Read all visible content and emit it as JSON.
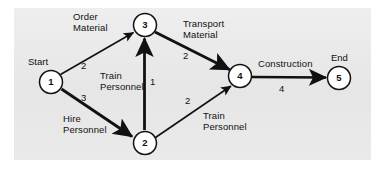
{
  "diagram": {
    "type": "activity-on-arc network",
    "background_color": "#e9e9e9",
    "page_color": "#ffffff",
    "line_color": "#111111",
    "node_fill": "#ffffff",
    "nodes": [
      {
        "id": "1",
        "label": "1",
        "cx": 51,
        "cy": 82,
        "r": 12,
        "terminal_label": "Start"
      },
      {
        "id": "2",
        "label": "2",
        "cx": 145,
        "cy": 143,
        "r": 12,
        "terminal_label": ""
      },
      {
        "id": "3",
        "label": "3",
        "cx": 145,
        "cy": 25,
        "r": 12,
        "terminal_label": ""
      },
      {
        "id": "4",
        "label": "4",
        "cx": 240,
        "cy": 76,
        "r": 12,
        "terminal_label": ""
      },
      {
        "id": "5",
        "label": "5",
        "cx": 339,
        "cy": 78,
        "r": 12,
        "terminal_label": "End"
      }
    ],
    "edges": [
      {
        "from": "1",
        "to": "3",
        "activity": "Order\nMaterial",
        "duration": "2"
      },
      {
        "from": "1",
        "to": "2",
        "activity": "Hire\nPersonnel",
        "duration": "3"
      },
      {
        "from": "2",
        "to": "3",
        "activity": "Train\nPersonnel",
        "duration": "1"
      },
      {
        "from": "3",
        "to": "4",
        "activity": "Transport\nMaterial",
        "duration": "2"
      },
      {
        "from": "2",
        "to": "4",
        "activity": "Train\nPersonnel",
        "duration": "2"
      },
      {
        "from": "4",
        "to": "5",
        "activity": "Construction",
        "duration": "4"
      }
    ],
    "labels": {
      "start": "Start",
      "end": "End",
      "order_material": "Order\nMaterial",
      "hire_personnel": "Hire\nPersonnel",
      "train_personnel_1_3": "Train\nPersonnel",
      "transport_material": "Transport\nMaterial",
      "train_personnel_2_4": "Train\nPersonnel",
      "construction": "Construction",
      "w_order_material": "2",
      "w_hire_personnel": "3",
      "w_train_2_3": "1",
      "w_transport_material": "2",
      "w_train_2_4": "2",
      "w_construction": "4",
      "node_1": "1",
      "node_2": "2",
      "node_3": "3",
      "node_4": "4",
      "node_5": "5"
    }
  }
}
